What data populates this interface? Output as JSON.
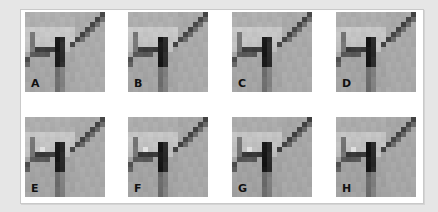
{
  "figure": {
    "panel_background": "#ffffff",
    "outer_background": "#e6e6e6",
    "grid_size": 16,
    "tiles": [
      {
        "label": "A",
        "variant": 0,
        "x": 25,
        "y": 12
      },
      {
        "label": "B",
        "variant": 1,
        "x": 128,
        "y": 12
      },
      {
        "label": "C",
        "variant": 2,
        "x": 232,
        "y": 12
      },
      {
        "label": "D",
        "variant": 3,
        "x": 336,
        "y": 12
      },
      {
        "label": "E",
        "variant": 4,
        "x": 25,
        "y": 117
      },
      {
        "label": "F",
        "variant": 5,
        "x": 128,
        "y": 117
      },
      {
        "label": "G",
        "variant": 6,
        "x": 232,
        "y": 117
      },
      {
        "label": "H",
        "variant": 7,
        "x": 336,
        "y": 117
      }
    ]
  }
}
